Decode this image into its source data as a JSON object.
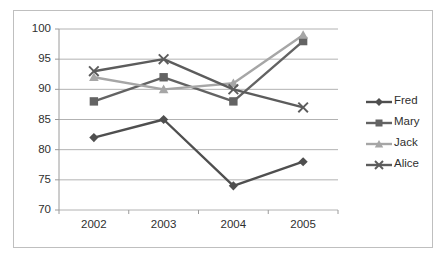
{
  "chart_data": {
    "type": "line",
    "title": "",
    "xlabel": "",
    "ylabel": "",
    "categories": [
      "2002",
      "2003",
      "2004",
      "2005"
    ],
    "x": [
      2002,
      2003,
      2004,
      2005
    ],
    "ylim": [
      70,
      100
    ],
    "yticks": [
      70,
      75,
      80,
      85,
      90,
      95,
      100
    ],
    "ytick_labels": [
      "70",
      "75",
      "80",
      "85",
      "90",
      "95",
      "100"
    ],
    "grid": "horizontal",
    "legend_position": "right",
    "series": [
      {
        "name": "Fred",
        "marker": "diamond",
        "color": "#4f4f4f",
        "values": [
          82,
          85,
          74,
          78
        ]
      },
      {
        "name": "Mary",
        "marker": "square",
        "color": "#636363",
        "values": [
          88,
          92,
          88,
          98
        ]
      },
      {
        "name": "Jack",
        "marker": "triangle",
        "color": "#a6a6a6",
        "values": [
          92,
          90,
          91,
          99
        ]
      },
      {
        "name": "Alice",
        "marker": "x",
        "color": "#5c5c5c",
        "values": [
          93,
          95,
          90,
          87
        ]
      }
    ]
  },
  "axes": {
    "y_tick_0": "70",
    "y_tick_1": "75",
    "y_tick_2": "80",
    "y_tick_3": "85",
    "y_tick_4": "90",
    "y_tick_5": "95",
    "y_tick_6": "100",
    "x_tick_0": "2002",
    "x_tick_1": "2003",
    "x_tick_2": "2004",
    "x_tick_3": "2005"
  },
  "legend": {
    "items": [
      {
        "label": "Fred"
      },
      {
        "label": "Mary"
      },
      {
        "label": "Jack"
      },
      {
        "label": "Alice"
      }
    ]
  },
  "colors": {
    "frame": "#bfbfbf",
    "grid": "#a9a9a9",
    "axis": "#9a9a9a",
    "text": "#2f2f2f",
    "background": "#ffffff"
  }
}
